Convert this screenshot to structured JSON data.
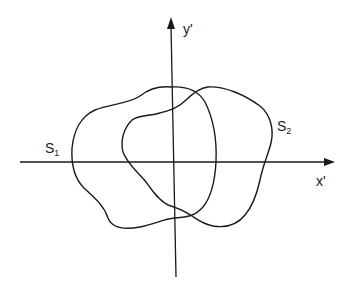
{
  "diagram": {
    "type": "coordinate-plane-with-two-closed-regions",
    "axes": {
      "x": {
        "label": "x'",
        "from": [
          20,
          162
        ],
        "to": [
          335,
          162
        ]
      },
      "y": {
        "label": "y'",
        "from": [
          176,
          277
        ],
        "to": [
          171,
          18
        ]
      }
    },
    "regions": [
      {
        "id": "S1",
        "label_main": "S",
        "label_sub": "1",
        "label_pos": [
          46,
          142
        ],
        "path": "M171,87 C160,86 150,88 140,96 C128,104 110,104 95,110 C80,117 74,130 72,148 C71,165 74,178 84,188 C96,199 104,206 108,218 C112,228 124,230 140,227 C155,224 163,219 175,218 C188,217 195,216 203,207 C212,196 215,180 216,162 C217,140 213,118 205,102 C198,90 186,86 171,87 Z"
      },
      {
        "id": "S2",
        "label_main": "S",
        "label_sub": "2",
        "label_pos": [
          278,
          120
        ],
        "path": "M208,87 C225,86 245,95 260,106 C271,115 274,130 271,143 C268,155 263,165 260,180 C256,198 252,207 245,215 C237,225 225,228 213,226 C203,224 198,220 192,216 C186,212 178,208 168,205 C158,200 152,190 146,182 C138,172 128,165 123,152 C120,140 124,128 132,120 C138,115 150,116 160,113 C170,110 178,108 186,100 C194,92 200,88 208,87 Z"
      }
    ]
  }
}
